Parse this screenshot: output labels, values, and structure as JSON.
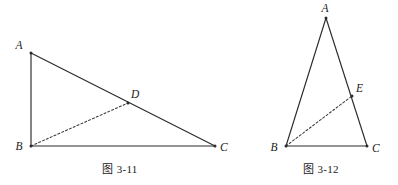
{
  "sheet": {
    "background": "#ffffff",
    "line_color": "#2b2b2b",
    "dash_color": "#3a3a3a",
    "label_color": "#1a1a1a"
  },
  "figures": [
    {
      "id": "figure-3-11",
      "caption": "图 3-11",
      "shape": "right triangle with cevian",
      "vertices": [
        {
          "name": "A",
          "label": "A",
          "x": 31,
          "y": 53,
          "label_dx": -12,
          "label_dy": -4
        },
        {
          "name": "B",
          "label": "B",
          "x": 31,
          "y": 146,
          "label_dx": -12,
          "label_dy": 4
        },
        {
          "name": "C",
          "label": "C",
          "x": 215,
          "y": 146,
          "label_dx": 5,
          "label_dy": 5
        }
      ],
      "points": [
        {
          "name": "D",
          "label": "D",
          "x": 128,
          "y": 103,
          "label_dx": 3,
          "label_dy": -5
        }
      ],
      "solid_edges": [
        {
          "from": "A",
          "to": "B"
        },
        {
          "from": "A",
          "to": "C"
        },
        {
          "from": "B",
          "to": "C"
        }
      ],
      "dashed_edges": [
        {
          "from": "B",
          "to": "D"
        }
      ]
    },
    {
      "id": "figure-3-12",
      "caption": "图 3-12",
      "shape": "tall isosceles triangle with cevian",
      "vertices": [
        {
          "name": "A",
          "label": "A",
          "x": 86,
          "y": 18,
          "label_dx": -4,
          "label_dy": -6
        },
        {
          "name": "B",
          "label": "B",
          "x": 46,
          "y": 146,
          "label_dx": -12,
          "label_dy": 5
        },
        {
          "name": "C",
          "label": "C",
          "x": 127,
          "y": 146,
          "label_dx": 5,
          "label_dy": 6
        }
      ],
      "points": [
        {
          "name": "E",
          "label": "E",
          "x": 112,
          "y": 96,
          "label_dx": 4,
          "label_dy": -4
        }
      ],
      "solid_edges": [
        {
          "from": "A",
          "to": "B"
        },
        {
          "from": "A",
          "to": "C"
        },
        {
          "from": "B",
          "to": "C"
        }
      ],
      "dashed_edges": [
        {
          "from": "B",
          "to": "E"
        }
      ]
    }
  ]
}
